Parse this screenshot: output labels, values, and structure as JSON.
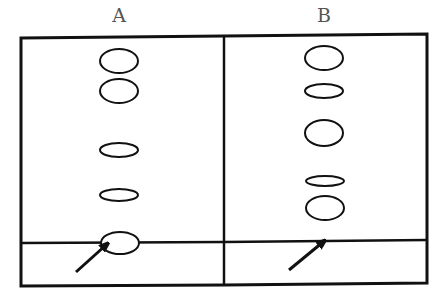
{
  "diagram": {
    "type": "chromatography-plates",
    "lanes": [
      {
        "label": "A",
        "spots": [
          {
            "cx": 119,
            "cy": 61,
            "rx": 19,
            "ry": 12
          },
          {
            "cx": 119,
            "cy": 91,
            "rx": 19,
            "ry": 12
          },
          {
            "cx": 119,
            "cy": 150,
            "rx": 19,
            "ry": 7
          },
          {
            "cx": 119,
            "cy": 195,
            "rx": 19,
            "ry": 6
          },
          {
            "cx": 120,
            "cy": 243,
            "rx": 19,
            "ry": 11
          }
        ],
        "arrow": {
          "x1": 76,
          "y1": 272,
          "x2": 106,
          "y2": 245
        }
      },
      {
        "label": "B",
        "spots": [
          {
            "cx": 324,
            "cy": 58,
            "rx": 19,
            "ry": 12
          },
          {
            "cx": 324,
            "cy": 91,
            "rx": 19,
            "ry": 7
          },
          {
            "cx": 324,
            "cy": 133,
            "rx": 19,
            "ry": 13
          },
          {
            "cx": 325,
            "cy": 181,
            "rx": 19,
            "ry": 5
          },
          {
            "cx": 325,
            "cy": 208,
            "rx": 19,
            "ry": 12
          }
        ],
        "arrow": {
          "x1": 289,
          "y1": 270,
          "x2": 323,
          "y2": 242
        }
      }
    ],
    "colors": {
      "stroke": "#111111",
      "background": "#ffffff"
    }
  }
}
